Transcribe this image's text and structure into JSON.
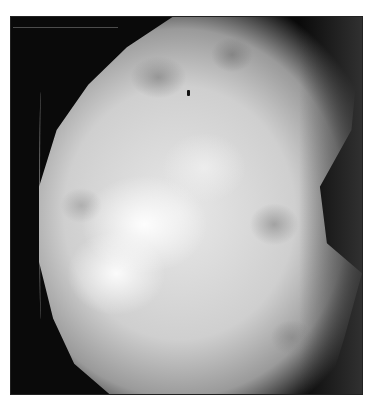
{
  "image": {
    "subject": "mammogram",
    "description": "Grayscale radiographic image of dense breast tissue on black background, with a small dark marker near the top center",
    "colors": {
      "background": "#0a0a0a",
      "tissue_bright": "#f0f0f0",
      "tissue_mid": "#a0a0a0",
      "page": "#ffffff"
    }
  }
}
